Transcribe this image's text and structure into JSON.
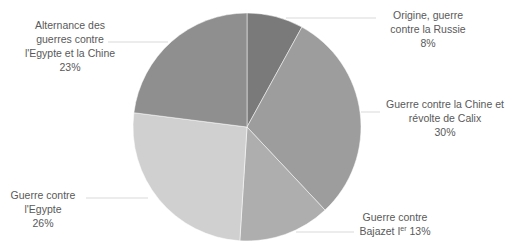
{
  "chart_data": {
    "type": "pie",
    "title": "",
    "start_angle_deg": 0,
    "direction": "clockwise",
    "slices": [
      {
        "label": "Origine, guerre contre la Russie",
        "value": 8,
        "percent_label": "8%",
        "color": "#7a7a7a"
      },
      {
        "label": "Guerre contre la Chine et révolte de Calix",
        "value": 30,
        "percent_label": "30%",
        "color": "#9d9d9d"
      },
      {
        "label": "Guerre contre Bajazet Ier",
        "value": 13,
        "percent_label": "13%",
        "color": "#aeaeae"
      },
      {
        "label": "Guerre contre l'Egypte",
        "value": 26,
        "percent_label": "26%",
        "color": "#d0d0d0"
      },
      {
        "label": "Alternance des guerres contre l'Egypte et la Chine",
        "value": 23,
        "percent_label": "23%",
        "color": "#8f8f8f"
      }
    ],
    "legend": "none",
    "data_labels": "outside with leader lines"
  },
  "labels": {
    "origine": {
      "line1": "Origine, guerre",
      "line2": "contre la Russie",
      "line3": "8%"
    },
    "chine_calix": {
      "line1": "Guerre contre la Chine et",
      "line2": "révolte de Calix",
      "line3": "30%"
    },
    "bajazet": {
      "line1": "Guerre contre",
      "line2a": "Bajazet I",
      "sup": "er",
      "line2b": " 13%"
    },
    "egypte": {
      "line1": "Guerre contre",
      "line2": "l'Egypte",
      "line3": "26%"
    },
    "alternance": {
      "line1": "Alternance des",
      "line2": "guerres contre",
      "line3": "l'Egypte et la Chine",
      "line4": "23%"
    }
  }
}
